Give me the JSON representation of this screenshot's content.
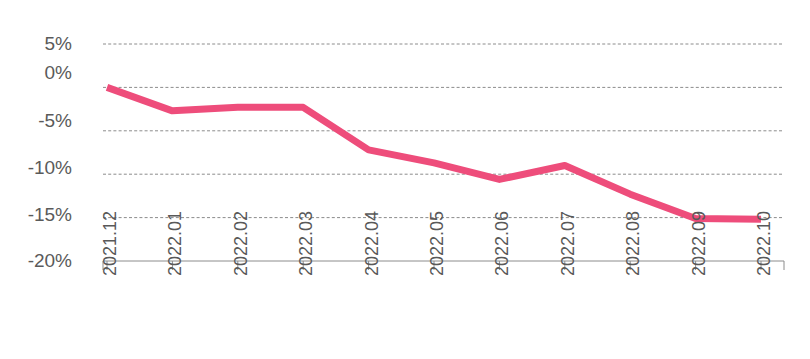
{
  "chart_data": {
    "type": "line",
    "title": "",
    "subtitle": "",
    "xlabel": "",
    "ylabel": "",
    "categories": [
      "2021.12",
      "2022.01",
      "2022.02",
      "2022.03",
      "2022.04",
      "2022.05",
      "2022.06",
      "2022.07",
      "2022.08",
      "2022.09",
      "2022.10"
    ],
    "series": [
      {
        "name": "series-1",
        "color": "#EE4D7B",
        "values": [
          0.0,
          -2.7,
          -2.3,
          -2.3,
          -7.2,
          -8.7,
          -10.6,
          -9.0,
          -12.3,
          -15.1,
          -15.2
        ]
      }
    ],
    "y_tick_labels": [
      "5%",
      "0%",
      "-5%",
      "-10%",
      "-15%",
      "-20%"
    ],
    "y_tick_values": [
      5,
      0,
      -5,
      -10,
      -15,
      -20
    ],
    "ylim": [
      -20,
      5
    ],
    "y_unit": "%",
    "grid": true,
    "grid_style": "dashed-horizontal",
    "legend": "none",
    "line_width_px": 7,
    "markers": false,
    "annotations": []
  },
  "colors": {
    "line": "#EE4D7B",
    "gridline": "#8c8c8c",
    "axis": "#8c8c8c",
    "tick_text": "#595959",
    "background": "#ffffff"
  }
}
